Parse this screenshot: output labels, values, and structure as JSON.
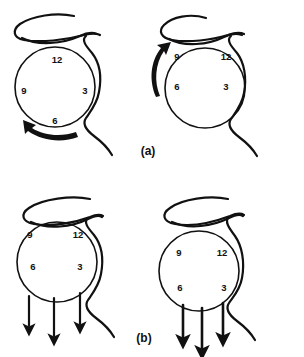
{
  "figure": {
    "background_color": "#ffffff",
    "ink_color": "#111111",
    "panel_labels": [
      {
        "id": "a",
        "text": "(a)",
        "x": 148,
        "y": 152
      },
      {
        "id": "b",
        "text": "(b)",
        "x": 144,
        "y": 339
      }
    ],
    "panels": [
      {
        "id": "a-left",
        "label": "(a)",
        "position": "top-left",
        "globe": {
          "cx": 55,
          "cy": 87,
          "r": 40
        },
        "clock_numbers": [
          {
            "value": "12",
            "x": 57,
            "y": 60,
            "position": "top"
          },
          {
            "value": "3",
            "x": 85,
            "y": 91,
            "position": "right"
          },
          {
            "value": "6",
            "x": 55,
            "y": 121,
            "position": "bottom"
          },
          {
            "value": "9",
            "x": 24,
            "y": 91,
            "position": "left"
          }
        ],
        "motion": {
          "kind": "curved-arrow",
          "direction": "counterclockwise",
          "location": "below-globe",
          "head_points": "up-left"
        },
        "clock_orientation_degrees": 0
      },
      {
        "id": "a-right",
        "label": "(a)",
        "position": "top-right",
        "globe": {
          "cx": 205,
          "cy": 88,
          "r": 40
        },
        "clock_numbers": [
          {
            "value": "9",
            "x": 177,
            "y": 57,
            "position": "top-left"
          },
          {
            "value": "12",
            "x": 226,
            "y": 57,
            "position": "top-right"
          },
          {
            "value": "6",
            "x": 177,
            "y": 87,
            "position": "bottom-left"
          },
          {
            "value": "3",
            "x": 226,
            "y": 87,
            "position": "bottom-right"
          }
        ],
        "motion": {
          "kind": "curved-arrow",
          "direction": "counterclockwise",
          "location": "left-of-globe",
          "head_points": "up"
        },
        "clock_orientation_degrees": 90
      },
      {
        "id": "b-left",
        "label": "(b)",
        "position": "bottom-left",
        "globe": {
          "cx": 57,
          "cy": 262,
          "r": 40
        },
        "clock_numbers": [
          {
            "value": "9",
            "x": 30,
            "y": 235,
            "position": "top-left"
          },
          {
            "value": "12",
            "x": 78,
            "y": 235,
            "position": "top-right"
          },
          {
            "value": "6",
            "x": 33,
            "y": 267,
            "position": "bottom-left"
          },
          {
            "value": "3",
            "x": 80,
            "y": 267,
            "position": "bottom-right"
          }
        ],
        "motion": {
          "kind": "straight-arrows",
          "direction": "downward",
          "count": 3,
          "location": "below-globe"
        },
        "clock_orientation_degrees": 90
      },
      {
        "id": "b-right",
        "label": "(b)",
        "position": "bottom-right",
        "globe": {
          "cx": 199,
          "cy": 271,
          "r": 40
        },
        "clock_numbers": [
          {
            "value": "9",
            "x": 179,
            "y": 253,
            "position": "top-left"
          },
          {
            "value": "12",
            "x": 222,
            "y": 253,
            "position": "top-right"
          },
          {
            "value": "6",
            "x": 180,
            "y": 288,
            "position": "bottom-left"
          },
          {
            "value": "3",
            "x": 224,
            "y": 288,
            "position": "bottom-right"
          }
        ],
        "motion": {
          "kind": "straight-arrows",
          "direction": "downward",
          "count": 3,
          "location": "below-globe"
        },
        "clock_orientation_degrees": 90
      }
    ],
    "icon_names": [
      "eyeball-globe-icon",
      "eyelid-loop-icon",
      "optic-nerve-curve-icon",
      "rotation-arrow-icon",
      "downward-arrow-icon"
    ]
  }
}
